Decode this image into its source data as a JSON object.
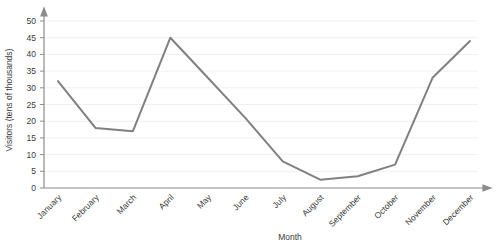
{
  "chart_data": {
    "type": "line",
    "title": "",
    "xlabel": "Month",
    "ylabel": "Visitors (tens of thousands)",
    "categories": [
      "January",
      "February",
      "March",
      "April",
      "May",
      "June",
      "July",
      "August",
      "September",
      "October",
      "November",
      "December"
    ],
    "values": [
      32,
      18,
      17,
      45,
      33,
      21,
      8,
      2.5,
      3.5,
      7,
      33,
      44
    ],
    "series": [
      {
        "name": "Visitors",
        "values": [
          32,
          18,
          17,
          45,
          33,
          21,
          8,
          2.5,
          3.5,
          7,
          33,
          44
        ]
      }
    ],
    "ylim": [
      0,
      50
    ],
    "ytick_values": [
      0,
      5,
      10,
      15,
      20,
      25,
      30,
      35,
      40,
      45,
      50
    ],
    "ytick_labels": [
      "0",
      "5",
      "10",
      "15",
      "20",
      "25",
      "30",
      "35",
      "40",
      "45",
      "50"
    ],
    "grid": true,
    "grid_axis": "y",
    "legend": false,
    "legend_position": "none",
    "line_color": "#808080",
    "grid_color": "#f0f0f0",
    "axis_color": "#8c8c8c",
    "text_color": "#3a3a3a",
    "xtick_rotation": -45,
    "axis_arrows": true
  },
  "axes": {
    "y_title": "Visitors (tens of thousands)",
    "x_title": "Month"
  }
}
